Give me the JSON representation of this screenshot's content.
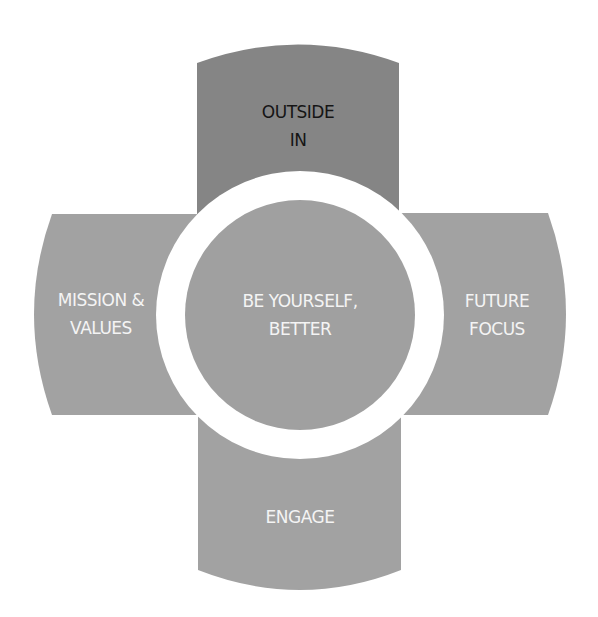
{
  "colors": {
    "background": "#ffffff",
    "arm": "#a2a2a2",
    "arm_top": "#858585",
    "ring": "#ffffff",
    "center": "#a0a0a0",
    "text_light": "#f4f4f4",
    "text_dark": "#151515"
  },
  "diagram": {
    "center": {
      "line1": "BE YOURSELF,",
      "line2": "BETTER"
    },
    "arms": {
      "top": {
        "line1": "OUTSIDE",
        "line2": "IN"
      },
      "left": {
        "line1": "MISSION &",
        "line2": "VALUES"
      },
      "right": {
        "line1": "FUTURE",
        "line2": "FOCUS"
      },
      "bottom": {
        "line1": "ENGAGE"
      }
    }
  }
}
